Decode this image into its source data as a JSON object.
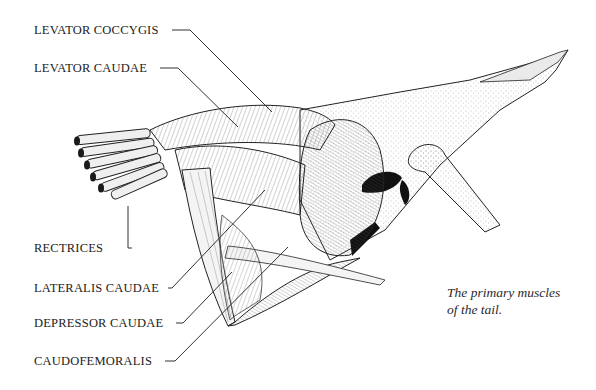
{
  "diagram": {
    "labels": [
      {
        "id": "levator-coccygis",
        "text": "LEVATOR COCCYGIS"
      },
      {
        "id": "levator-caudae",
        "text": "LEVATOR CAUDAE"
      },
      {
        "id": "rectrices",
        "text": "RECTRICES"
      },
      {
        "id": "lateralis-caudae",
        "text": "LATERALIS CAUDAE"
      },
      {
        "id": "depressor-caudae",
        "text": "DEPRESSOR CAUDAE"
      },
      {
        "id": "caudofemoralis",
        "text": "CAUDOFEMORALIS"
      }
    ],
    "caption_line1": "The primary muscles",
    "caption_line2": "of the tail.",
    "colors": {
      "ink": "#222222",
      "paper": "#ffffff",
      "muscle_fill": "#f2f2f2",
      "shadow": "#1a1a1a"
    }
  }
}
